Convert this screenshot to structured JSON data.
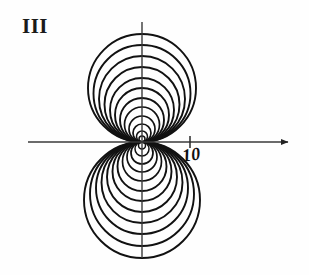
{
  "figure": {
    "panel_label": "III",
    "background_color": "#fefefe",
    "stroke_color": "#111111",
    "axis_color": "#3a3a3a"
  },
  "axes": {
    "x_axis": {
      "name": "horizontal-axis",
      "x_start": 28,
      "x_end": 288,
      "y": 142,
      "has_arrow": true,
      "arrow_end": "right"
    },
    "y_axis": {
      "name": "vertical-axis",
      "x": 142,
      "y_start": 22,
      "y_end": 258,
      "has_arrow": false
    },
    "origin": {
      "x": 142,
      "y": 142
    }
  },
  "ticks": [
    {
      "name": "x-tick-10",
      "label": "10",
      "x": 190,
      "y": 142,
      "half_length": 6
    }
  ],
  "chart_data": {
    "type": "line",
    "title": "",
    "subtitle": "",
    "xlabel": "",
    "ylabel": "",
    "grid": false,
    "legend": "none",
    "curve_family": "circles tangent to x-axis at origin",
    "center_x": 142,
    "tangent_y": 142,
    "upper_radii": [
      54,
      48.5,
      43,
      37.5,
      32,
      27,
      22,
      17.5,
      13,
      9,
      5.5,
      3
    ],
    "lower_radii": [
      58,
      52,
      46,
      40.5,
      35,
      29.5,
      24.5,
      19.5,
      15,
      11,
      7,
      3.5
    ],
    "upper_count": 12,
    "lower_count": 12,
    "xlim": [
      28,
      288
    ],
    "ylim": [
      22,
      258
    ],
    "annotations": [
      {
        "text": "III",
        "x": 22,
        "y": 16
      },
      {
        "text": "10",
        "x": 181,
        "y": 147
      }
    ]
  }
}
